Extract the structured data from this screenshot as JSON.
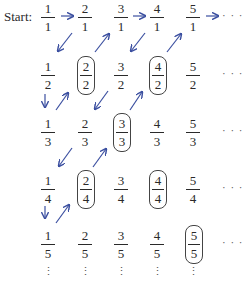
{
  "diagram": {
    "start_label": "Start:",
    "arrow_color": "#3b4fa0",
    "grid": [
      [
        {
          "num": "1",
          "den": "1",
          "circled": false
        },
        {
          "num": "2",
          "den": "1",
          "circled": false
        },
        {
          "num": "3",
          "den": "1",
          "circled": false
        },
        {
          "num": "4",
          "den": "1",
          "circled": false
        },
        {
          "num": "5",
          "den": "1",
          "circled": false
        }
      ],
      [
        {
          "num": "1",
          "den": "2",
          "circled": false
        },
        {
          "num": "2",
          "den": "2",
          "circled": true
        },
        {
          "num": "3",
          "den": "2",
          "circled": false
        },
        {
          "num": "4",
          "den": "2",
          "circled": true
        },
        {
          "num": "5",
          "den": "2",
          "circled": false
        }
      ],
      [
        {
          "num": "1",
          "den": "3",
          "circled": false
        },
        {
          "num": "2",
          "den": "3",
          "circled": false
        },
        {
          "num": "3",
          "den": "3",
          "circled": true
        },
        {
          "num": "4",
          "den": "3",
          "circled": false
        },
        {
          "num": "5",
          "den": "3",
          "circled": false
        }
      ],
      [
        {
          "num": "1",
          "den": "4",
          "circled": false
        },
        {
          "num": "2",
          "den": "4",
          "circled": true
        },
        {
          "num": "3",
          "den": "4",
          "circled": false
        },
        {
          "num": "4",
          "den": "4",
          "circled": true
        },
        {
          "num": "5",
          "den": "4",
          "circled": false
        }
      ],
      [
        {
          "num": "1",
          "den": "5",
          "circled": false
        },
        {
          "num": "2",
          "den": "5",
          "circled": false
        },
        {
          "num": "3",
          "den": "5",
          "circled": false
        },
        {
          "num": "4",
          "den": "5",
          "circled": false
        },
        {
          "num": "5",
          "den": "5",
          "circled": true
        }
      ]
    ],
    "row_ellipsis": "· · ·",
    "col_ellipsis": "⋮",
    "path_order": [
      "1/1",
      "2/1",
      "1/2",
      "1/3",
      "2/2",
      "3/1",
      "4/1",
      "3/2",
      "2/3",
      "1/4",
      "1/5",
      "2/4",
      "3/3",
      "4/2",
      "5/1"
    ]
  }
}
